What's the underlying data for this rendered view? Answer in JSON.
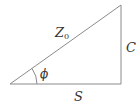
{
  "diagram": {
    "type": "right-triangle",
    "stroke_color": "#8a8a8a",
    "label_color": "#333333",
    "labels": {
      "hypotenuse": "Z",
      "hypotenuse_subscript": "0",
      "vertical_side": "C",
      "horizontal_side": "S",
      "angle": "ϕ"
    }
  }
}
